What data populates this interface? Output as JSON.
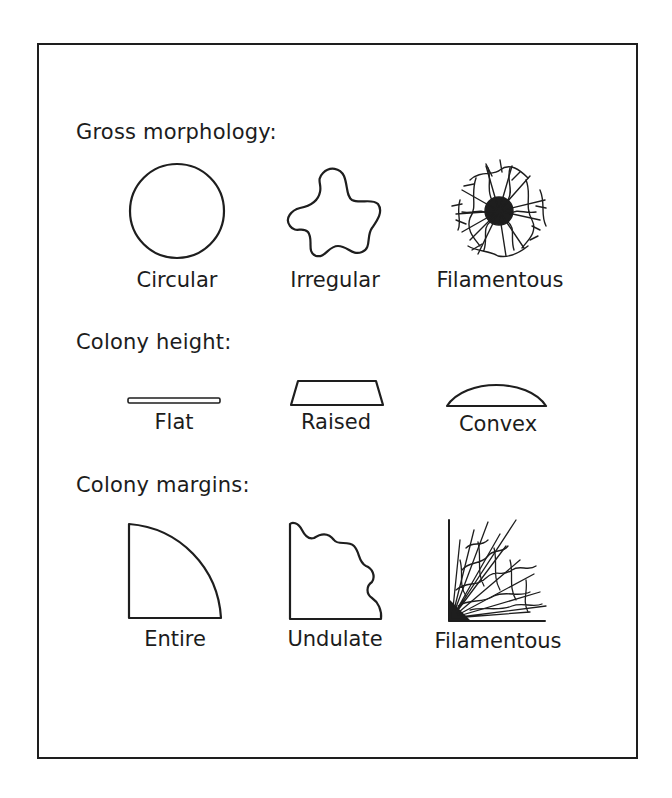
{
  "sections": [
    {
      "heading": "Gross morphology:",
      "items": [
        {
          "label": "Circular",
          "icon": "circle-outline-icon"
        },
        {
          "label": "Irregular",
          "icon": "irregular-blob-icon"
        },
        {
          "label": "Filamentous",
          "icon": "filamentous-tangle-icon"
        }
      ]
    },
    {
      "heading": "Colony height:",
      "items": [
        {
          "label": "Flat",
          "icon": "flat-bar-icon"
        },
        {
          "label": "Raised",
          "icon": "trapezoid-icon"
        },
        {
          "label": "Convex",
          "icon": "dome-icon"
        }
      ]
    },
    {
      "heading": "Colony margins:",
      "items": [
        {
          "label": "Entire",
          "icon": "quarter-circle-icon"
        },
        {
          "label": "Undulate",
          "icon": "wavy-quarter-icon"
        },
        {
          "label": "Filamentous",
          "icon": "filamentous-corner-icon"
        }
      ]
    }
  ],
  "colors": {
    "stroke": "#1e1e1e",
    "background": "#ffffff"
  }
}
